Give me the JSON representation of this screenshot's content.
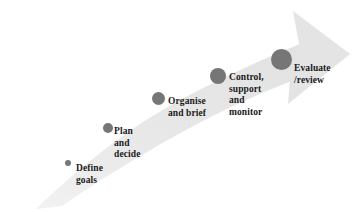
{
  "diagram": {
    "arrow": {
      "name": "ascending-curved-arrow",
      "band_color": "#e6e6e6",
      "band_color_light": "#efefef",
      "direction": "left-to-right ascending",
      "head_position": "upper-right"
    },
    "colors": {
      "dot": "#767676",
      "text": "#1a1a1a",
      "background": "#ffffff"
    },
    "stages": [
      {
        "id": "define-goals",
        "index": 1,
        "lines": [
          "Define",
          "goals"
        ],
        "dot": {
          "x": 65,
          "y": 160,
          "size": 6
        },
        "label": {
          "x": 76,
          "y": 163
        }
      },
      {
        "id": "plan-and-decide",
        "index": 2,
        "lines": [
          "Plan",
          "and",
          "decide"
        ],
        "dot": {
          "x": 103,
          "y": 123,
          "size": 10
        },
        "label": {
          "x": 114,
          "y": 126
        }
      },
      {
        "id": "organise-and-brief",
        "index": 3,
        "lines": [
          "Organise",
          "and brief"
        ],
        "dot": {
          "x": 152,
          "y": 92,
          "size": 13
        },
        "label": {
          "x": 168,
          "y": 96
        }
      },
      {
        "id": "control-support-and-monitor",
        "index": 4,
        "lines": [
          "Control,",
          "support",
          "and",
          "monitor"
        ],
        "dot": {
          "x": 210,
          "y": 68,
          "size": 16
        },
        "label": {
          "x": 229,
          "y": 72
        }
      },
      {
        "id": "evaluate-review",
        "index": 5,
        "lines": [
          "Evaluate",
          "/review"
        ],
        "dot": {
          "x": 271,
          "y": 49,
          "size": 21
        },
        "label": {
          "x": 294,
          "y": 63
        }
      }
    ]
  }
}
